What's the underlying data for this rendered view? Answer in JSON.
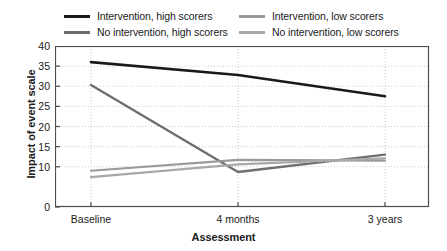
{
  "chart_data": {
    "type": "line",
    "title": "",
    "xlabel": "Assessment",
    "ylabel": "Impact of event scale",
    "categories": [
      "Baseline",
      "4 months",
      "3 years"
    ],
    "x_tick_labels": [
      "Baseline",
      "4 months",
      "3 years"
    ],
    "y_tick_labels": [
      "0",
      "10",
      "15",
      "20",
      "25",
      "30",
      "35",
      "40"
    ],
    "y_tick_values": [
      0,
      10,
      15,
      20,
      25,
      30,
      35,
      40
    ],
    "ylim": [
      0,
      40
    ],
    "grid": "dotted-both",
    "legend_position": "top",
    "series": [
      {
        "name": "Intervention, high scorers",
        "color": "#1a1a1a",
        "width": 2.6,
        "values": [
          36.0,
          32.8,
          27.5
        ]
      },
      {
        "name": "No intervention, high scorers",
        "color": "#6e6e6e",
        "width": 2.4,
        "values": [
          30.3,
          8.7,
          13.0
        ]
      },
      {
        "name": "Intervention, low scorers",
        "color": "#9a9a9a",
        "width": 2.2,
        "values": [
          9.0,
          11.7,
          11.5
        ]
      },
      {
        "name": "No intervention, low scorers",
        "color": "#a8a8a8",
        "width": 2.2,
        "values": [
          7.4,
          10.6,
          12.1
        ]
      }
    ]
  },
  "legend": {
    "entries": [
      {
        "label": "Intervention, high scorers",
        "color": "#1a1a1a"
      },
      {
        "label": "Intervention, low scorers",
        "color": "#9a9a9a"
      },
      {
        "label": "No intervention, high scorers",
        "color": "#6e6e6e"
      },
      {
        "label": "No intervention, low scorers",
        "color": "#a8a8a8"
      }
    ]
  },
  "axes": {
    "y_title": "Impact of event scale",
    "x_title": "Assessment"
  },
  "colors": {
    "axis": "#4d4d4d",
    "grid": "#cccccc",
    "background": "#ffffff",
    "text": "#1a1a1a"
  }
}
